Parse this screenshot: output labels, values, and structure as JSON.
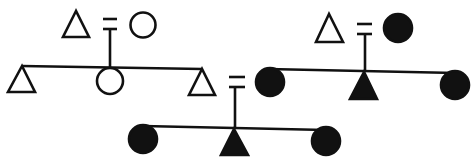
{
  "diagram": {
    "type": "kinship-chart",
    "stroke_color": "#111111",
    "background": "#ffffff",
    "legend": {
      "triangle": "male",
      "circle": "female",
      "filled": "shaded/affiliated",
      "equals": "marriage"
    },
    "families": [
      {
        "id": "family-1",
        "parents": [
          {
            "sex": "male",
            "shape": "triangle",
            "filled": false
          },
          {
            "sex": "female",
            "shape": "circle",
            "filled": false
          }
        ],
        "children": [
          {
            "sex": "male",
            "shape": "triangle",
            "filled": false
          },
          {
            "sex": "female",
            "shape": "circle",
            "filled": false
          },
          {
            "sex": "male",
            "shape": "triangle",
            "filled": false
          }
        ]
      },
      {
        "id": "family-2",
        "parents": [
          {
            "sex": "male",
            "shape": "triangle",
            "filled": false
          },
          {
            "sex": "female",
            "shape": "circle",
            "filled": true
          }
        ],
        "children": [
          {
            "sex": "female",
            "shape": "circle",
            "filled": true
          },
          {
            "sex": "male",
            "shape": "triangle",
            "filled": true
          },
          {
            "sex": "female",
            "shape": "circle",
            "filled": true
          }
        ]
      },
      {
        "id": "family-3",
        "parents_from": [
          "family-1 right son",
          "family-2 left daughter"
        ],
        "children": [
          {
            "sex": "female",
            "shape": "circle",
            "filled": true
          },
          {
            "sex": "male",
            "shape": "triangle",
            "filled": true
          },
          {
            "sex": "female",
            "shape": "circle",
            "filled": true
          }
        ]
      }
    ]
  }
}
